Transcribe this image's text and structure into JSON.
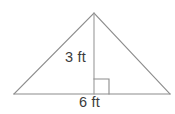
{
  "figure": {
    "kind": "triangle-with-altitude",
    "background_color": "#ffffff",
    "stroke_color": "#8c8c8c",
    "text_color": "#3b3b3b",
    "labels": {
      "height": "3 ft",
      "base": "6 ft"
    },
    "geometry": {
      "apex": {
        "x": 94,
        "y": 13
      },
      "left_vertex": {
        "x": 14,
        "y": 94
      },
      "right_vertex": {
        "x": 170,
        "y": 94
      },
      "altitude_foot": {
        "x": 94,
        "y": 94
      },
      "right_angle_marker": {
        "x": 94,
        "y": 79,
        "size": 15
      }
    }
  }
}
